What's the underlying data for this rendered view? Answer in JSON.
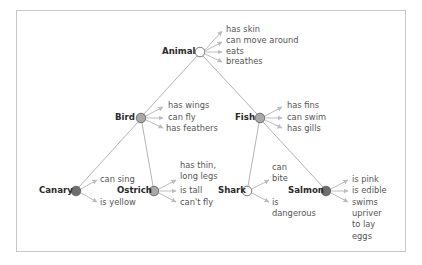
{
  "diagram": {
    "type": "semantic-network",
    "colors": {
      "edge": "#b4b4b4",
      "arrow": "#bdbdbd",
      "node_white": "#ffffff",
      "node_light": "#a8a8a8",
      "node_dark": "#6e6e6e",
      "node_stroke": "#5a5a5a",
      "frame": "#c8c8c8"
    },
    "nodes": [
      {
        "id": "animal",
        "label": "Animal",
        "x": 200,
        "y": 52,
        "fill": "white",
        "properties": [
          "has skin",
          "can move around",
          "eats",
          "breathes"
        ]
      },
      {
        "id": "bird",
        "label": "Bird",
        "x": 141,
        "y": 118,
        "fill": "light",
        "properties": [
          "has wings",
          "can fly",
          "has feathers"
        ]
      },
      {
        "id": "fish",
        "label": "Fish",
        "x": 260,
        "y": 118,
        "fill": "light",
        "properties": [
          "has fins",
          "can swim",
          "has gills"
        ]
      },
      {
        "id": "canary",
        "label": "Canary",
        "x": 76,
        "y": 191,
        "fill": "dark",
        "properties": [
          "can sing",
          "is yellow"
        ]
      },
      {
        "id": "ostrich",
        "label": "Ostrich",
        "x": 154,
        "y": 191,
        "fill": "light",
        "properties": [
          "has thin, long legs",
          "is tall",
          "can't fly"
        ]
      },
      {
        "id": "shark",
        "label": "Shark",
        "x": 247,
        "y": 191,
        "fill": "white",
        "properties": [
          "can bite",
          "is dangerous"
        ]
      },
      {
        "id": "salmon",
        "label": "Salmon",
        "x": 326,
        "y": 191,
        "fill": "dark",
        "properties": [
          "is pink",
          "is edible",
          "swims upriver to lay eggs"
        ]
      }
    ],
    "edges": [
      {
        "from": "animal",
        "to": "bird"
      },
      {
        "from": "animal",
        "to": "fish"
      },
      {
        "from": "bird",
        "to": "canary"
      },
      {
        "from": "bird",
        "to": "ostrich"
      },
      {
        "from": "fish",
        "to": "shark"
      },
      {
        "from": "fish",
        "to": "salmon"
      }
    ],
    "labels": {
      "animal": "Animal",
      "animal_props": [
        "has skin",
        "can move around",
        "eats",
        "breathes"
      ],
      "bird": "Bird",
      "bird_props": [
        "has wings",
        "can fly",
        "has feathers"
      ],
      "fish": "Fish",
      "fish_props": [
        "has fins",
        "can swim",
        "has gills"
      ],
      "canary": "Canary",
      "canary_props": [
        "can sing",
        "is yellow"
      ],
      "ostrich": "Ostrich",
      "ostrich_props": [
        "has thin,",
        "long legs",
        "is tall",
        "can't fly"
      ],
      "shark": "Shark",
      "shark_props": [
        "can",
        "bite",
        "is",
        "dangerous"
      ],
      "salmon": "Salmon",
      "salmon_props": [
        "is pink",
        "is edible",
        "swims",
        "upriver",
        "to lay",
        "eggs"
      ]
    }
  }
}
